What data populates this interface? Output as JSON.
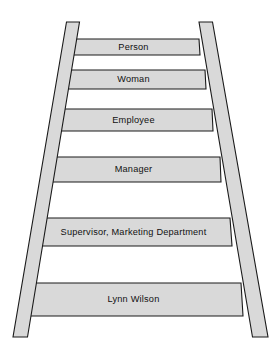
{
  "figure": {
    "name": "abstraction-ladder",
    "background_color": "#ffffff",
    "rail_fill": "#d9d9d9",
    "rung_fill": "#d9d9d9",
    "outline_color": "#1a1a1a",
    "text_color": "#111111"
  },
  "rungs": [
    {
      "label": "Person",
      "level": 1
    },
    {
      "label": "Woman",
      "level": 2
    },
    {
      "label": "Employee",
      "level": 3
    },
    {
      "label": "Manager",
      "level": 4
    },
    {
      "label": "Supervisor, Marketing Department",
      "level": 5
    },
    {
      "label": "Lynn Wilson",
      "level": 6
    }
  ]
}
